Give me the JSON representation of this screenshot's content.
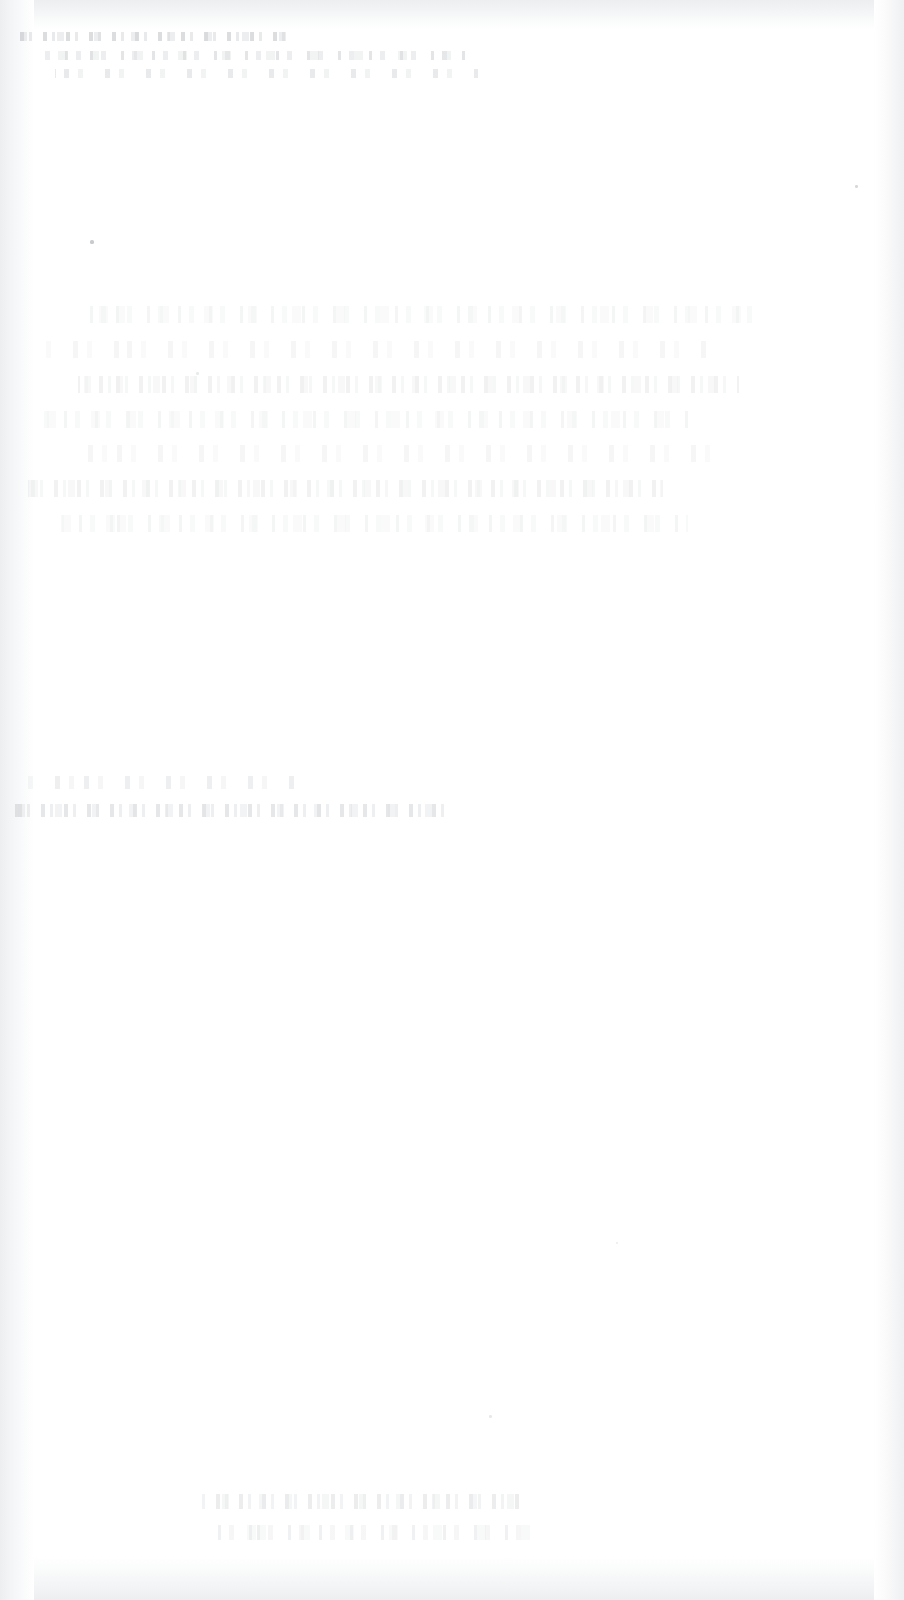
{
  "page": {
    "kind": "faded-scanned-document",
    "width_px": 904,
    "height_px": 1600,
    "orientation": "portrait",
    "background_color": "#ffffff",
    "legible_text": "",
    "condition_note": "Page is almost entirely blank; ink is washed out and no characters are legible at any zoom level."
  },
  "edges": {
    "note": "Faint grey scanner shadow along all four margins.",
    "shadow_color": "#eceef0",
    "left_width_px": 34,
    "right_width_px": 30,
    "top_height_px": 30,
    "bottom_height_px": 44
  },
  "ghost_regions": [
    {
      "id": "ghost-band-top",
      "label": "upper heading block",
      "x": 20,
      "y": 32,
      "width": 432,
      "height": 56,
      "opacity": 0.3,
      "tone": "#787e85",
      "line_count": 3,
      "legible_text": ""
    },
    {
      "id": "ghost-band-body",
      "label": "central paragraph block",
      "x": 28,
      "y": 306,
      "width": 836,
      "height": 244,
      "opacity": 0.115,
      "tone": "#868c93",
      "line_count": 7,
      "legible_text": ""
    },
    {
      "id": "ghost-band-annotation",
      "label": "lower-left annotation block",
      "x": 4,
      "y": 776,
      "width": 444,
      "height": 56,
      "opacity": 0.22,
      "tone": "#80868d",
      "line_count": 2,
      "legible_text": ""
    },
    {
      "id": "ghost-band-footer",
      "label": "footer line",
      "x": 186,
      "y": 1494,
      "width": 398,
      "height": 62,
      "opacity": 0.16,
      "tone": "#868c93",
      "line_count": 2,
      "legible_text": ""
    }
  ],
  "specks": [
    {
      "id": "speck-1",
      "x": 90,
      "y": 240,
      "size": 4,
      "tone": "#9aa0a6",
      "opacity": 0.55
    },
    {
      "id": "speck-2",
      "x": 855,
      "y": 185,
      "size": 3,
      "tone": "#a4aaaf",
      "opacity": 0.45
    },
    {
      "id": "speck-3",
      "x": 489,
      "y": 1415,
      "size": 3,
      "tone": "#aeb3b8",
      "opacity": 0.3
    },
    {
      "id": "speck-4",
      "x": 196,
      "y": 372,
      "size": 3,
      "tone": "#aeb3b8",
      "opacity": 0.28
    },
    {
      "id": "speck-5",
      "x": 616,
      "y": 1242,
      "size": 2,
      "tone": "#b2b7bb",
      "opacity": 0.25
    }
  ]
}
